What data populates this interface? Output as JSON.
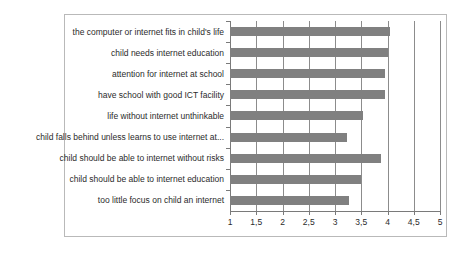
{
  "chart_data": {
    "type": "bar",
    "orientation": "horizontal",
    "title": "",
    "subtitle": "",
    "xlabel": "",
    "ylabel": "",
    "xlim": [
      1,
      5
    ],
    "ylim": null,
    "grid": true,
    "grid_axis": "x",
    "legend": false,
    "legend_position": "none",
    "bar_color": "#808080",
    "frame_color": "#b9b9b9",
    "axis_color": "#7a7a7a",
    "gridline_color": "#8c8c8c",
    "decimal_separator": ",",
    "xticks": [
      1,
      1.5,
      2,
      2.5,
      3,
      3.5,
      4,
      4.5,
      5
    ],
    "xticklabels": [
      "1",
      "1,5",
      "2",
      "2,5",
      "3",
      "3,5",
      "4",
      "4,5",
      "5"
    ],
    "categories": [
      "the computer or internet fits in child's life",
      "child needs internet education",
      "attention for internet at school",
      "have school with good ICT facility",
      "life without internet unthinkable",
      "child falls behind unless learns to use internet at...",
      "child should be able to internet without risks",
      "child should be able to internet education",
      "too little focus on child an internet"
    ],
    "values": [
      4.05,
      4.0,
      3.95,
      3.95,
      3.53,
      3.23,
      3.88,
      3.5,
      3.27
    ]
  }
}
